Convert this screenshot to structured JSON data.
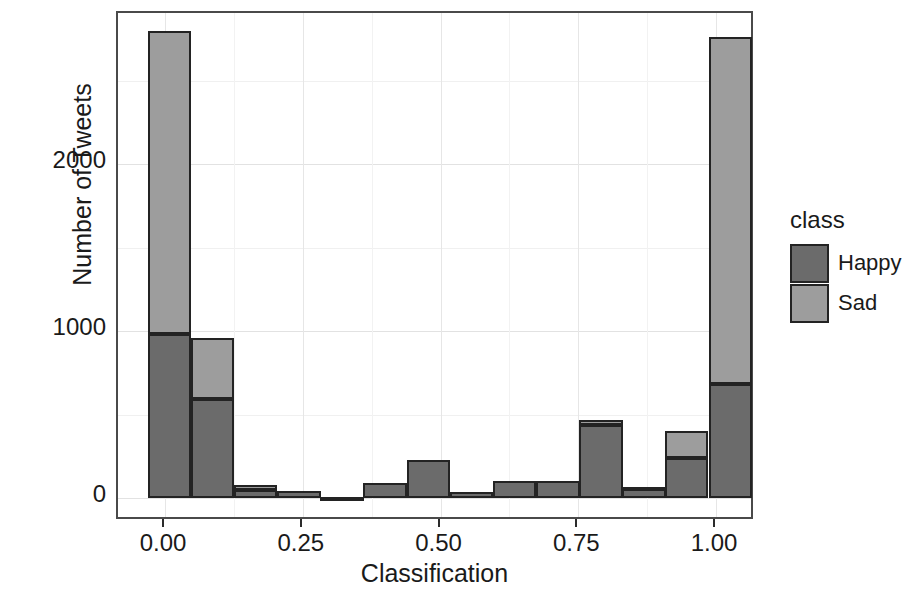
{
  "chart_data": {
    "type": "bar",
    "subtype": "stacked-histogram",
    "title": "",
    "xlabel": "Classification",
    "ylabel": "Number of Tweets",
    "xlim": [
      -0.055,
      1.08
    ],
    "ylim": [
      0,
      3000
    ],
    "xticks": [
      "0.00",
      "0.25",
      "0.50",
      "0.75",
      "1.00"
    ],
    "xtick_values": [
      0.0,
      0.25,
      0.5,
      0.75,
      1.0
    ],
    "yticks": [
      "0",
      "1000",
      "2000"
    ],
    "ytick_values": [
      0,
      1000,
      2000
    ],
    "grid": true,
    "grid_color": "#e3e3e3",
    "panel_border_color": "#4a4a4a",
    "bar_outline_color": "#232323",
    "legend": {
      "title": "class",
      "position": "right",
      "entries": [
        {
          "label": "Happy",
          "color": "#6b6b6b"
        },
        {
          "label": "Sad",
          "color": "#9d9d9d"
        }
      ]
    },
    "bin_width": 0.0784,
    "bins": [
      {
        "x_center": 0.01,
        "x_left": -0.031,
        "happy": 980,
        "sad": 1815,
        "total": 2795
      },
      {
        "x_center": 0.088,
        "x_left": 0.047,
        "happy": 590,
        "sad": 370,
        "total": 960
      },
      {
        "x_center": 0.166,
        "x_left": 0.125,
        "happy": 50,
        "sad": 30,
        "total": 80
      },
      {
        "x_center": 0.245,
        "x_left": 0.204,
        "happy": 40,
        "sad": 0,
        "total": 40
      },
      {
        "x_center": 0.323,
        "x_left": 0.282,
        "happy": 8,
        "sad": 0,
        "total": 8
      },
      {
        "x_center": 0.401,
        "x_left": 0.36,
        "happy": 90,
        "sad": 0,
        "total": 90
      },
      {
        "x_center": 0.479,
        "x_left": 0.439,
        "happy": 230,
        "sad": 0,
        "total": 230
      },
      {
        "x_center": 0.558,
        "x_left": 0.517,
        "happy": 35,
        "sad": 0,
        "total": 35
      },
      {
        "x_center": 0.636,
        "x_left": 0.595,
        "happy": 100,
        "sad": 0,
        "total": 100
      },
      {
        "x_center": 0.714,
        "x_left": 0.674,
        "happy": 100,
        "sad": 0,
        "total": 100
      },
      {
        "x_center": 0.792,
        "x_left": 0.752,
        "happy": 440,
        "sad": 30,
        "total": 470
      },
      {
        "x_center": 0.871,
        "x_left": 0.83,
        "happy": 55,
        "sad": 10,
        "total": 65
      },
      {
        "x_center": 0.949,
        "x_left": 0.908,
        "happy": 240,
        "sad": 160,
        "total": 400
      },
      {
        "x_center": 1.027,
        "x_left": 0.987,
        "happy": 680,
        "sad": 2080,
        "total": 2760
      }
    ]
  }
}
